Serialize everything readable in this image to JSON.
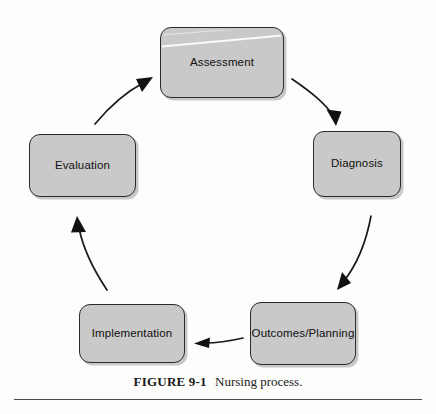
{
  "figure": {
    "caption_number": "FIGURE 9-1",
    "caption_title": "Nursing process.",
    "title": "Nursing process"
  },
  "diagram": {
    "type": "cycle",
    "direction": "clockwise",
    "node_fill_color": "#c9c9c9",
    "node_border_color": "#2b2b2b",
    "background_color": "#fdfdfc",
    "arrow_color": "#1a1a1a",
    "nodes": [
      {
        "id": "assessment",
        "label": "Assessment",
        "order": 1
      },
      {
        "id": "diagnosis",
        "label": "Diagnosis",
        "order": 2
      },
      {
        "id": "outcomes-planning",
        "label": "Outcomes/Planning",
        "order": 3
      },
      {
        "id": "implementation",
        "label": "Implementation",
        "order": 4
      },
      {
        "id": "evaluation",
        "label": "Evaluation",
        "order": 5
      }
    ],
    "connectors": [
      {
        "id": "arrow-assessment-to-diagnosis",
        "from": "assessment",
        "to": "diagnosis",
        "style": "curved-arrow"
      },
      {
        "id": "arrow-diagnosis-to-outcomes",
        "from": "diagnosis",
        "to": "outcomes-planning",
        "style": "curved-arrow"
      },
      {
        "id": "arrow-outcomes-to-implementation",
        "from": "outcomes-planning",
        "to": "implementation",
        "style": "straight-arrow"
      },
      {
        "id": "arrow-implementation-to-evaluation",
        "from": "implementation",
        "to": "evaluation",
        "style": "curved-arrow"
      },
      {
        "id": "arrow-evaluation-to-assessment",
        "from": "evaluation",
        "to": "assessment",
        "style": "curved-arrow"
      }
    ]
  }
}
